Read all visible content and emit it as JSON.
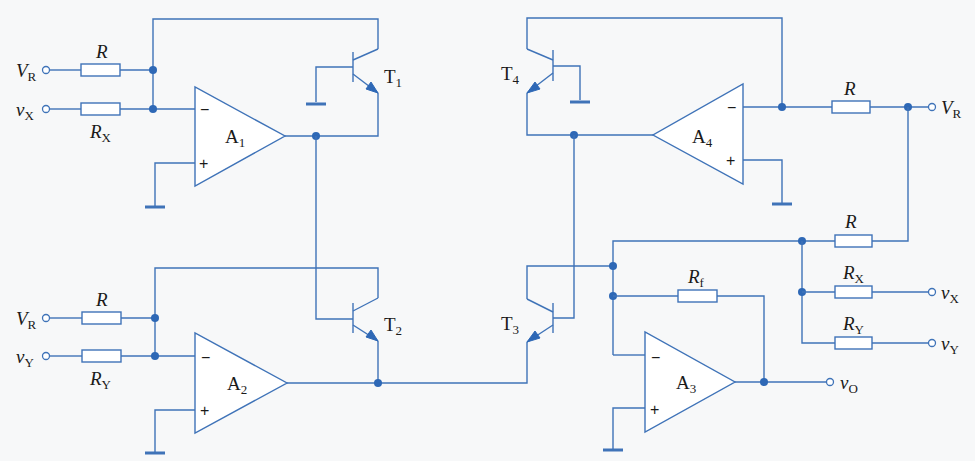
{
  "diagram": {
    "type": "analog multiplier/divider circuit (log-antilog with op-amps and BJTs)",
    "colors": {
      "wire": "#3f73b8",
      "node": "#2e68b6",
      "text": "#1a1a1a",
      "background": "#f7f8f9"
    },
    "opamps": [
      {
        "id": "A1",
        "label": "A",
        "sub": "1",
        "minus": "−",
        "plus": "+"
      },
      {
        "id": "A2",
        "label": "A",
        "sub": "2",
        "minus": "−",
        "plus": "+"
      },
      {
        "id": "A3",
        "label": "A",
        "sub": "3",
        "minus": "−",
        "plus": "+"
      },
      {
        "id": "A4",
        "label": "A",
        "sub": "4",
        "minus": "−",
        "plus": "+"
      }
    ],
    "transistors": [
      {
        "id": "T1",
        "label": "T",
        "sub": "1",
        "type": "NPN"
      },
      {
        "id": "T2",
        "label": "T",
        "sub": "2",
        "type": "NPN"
      },
      {
        "id": "T3",
        "label": "T",
        "sub": "3",
        "type": "NPN"
      },
      {
        "id": "T4",
        "label": "T",
        "sub": "4",
        "type": "NPN"
      }
    ],
    "resistors": [
      {
        "id": "R_A1_VR",
        "label": "R",
        "sub": ""
      },
      {
        "id": "R_A1_X",
        "label": "R",
        "sub": "X"
      },
      {
        "id": "R_A2_VR",
        "label": "R",
        "sub": ""
      },
      {
        "id": "R_A2_Y",
        "label": "R",
        "sub": "Y"
      },
      {
        "id": "R_A4_VR",
        "label": "R",
        "sub": ""
      },
      {
        "id": "R_sum",
        "label": "R",
        "sub": ""
      },
      {
        "id": "R_sum_X",
        "label": "R",
        "sub": "X"
      },
      {
        "id": "R_sum_Y",
        "label": "R",
        "sub": "Y"
      },
      {
        "id": "R_f",
        "label": "R",
        "sub": "f"
      }
    ],
    "terminals": [
      {
        "id": "VR_top_left",
        "label": "V",
        "sub": "R"
      },
      {
        "id": "vX_left",
        "label": "v",
        "sub": "X"
      },
      {
        "id": "VR_bottom_left",
        "label": "V",
        "sub": "R"
      },
      {
        "id": "vY_left",
        "label": "v",
        "sub": "Y"
      },
      {
        "id": "VR_right",
        "label": "V",
        "sub": "R"
      },
      {
        "id": "vX_right",
        "label": "v",
        "sub": "X"
      },
      {
        "id": "vY_right",
        "label": "v",
        "sub": "Y"
      },
      {
        "id": "vO",
        "label": "v",
        "sub": "O"
      }
    ]
  }
}
